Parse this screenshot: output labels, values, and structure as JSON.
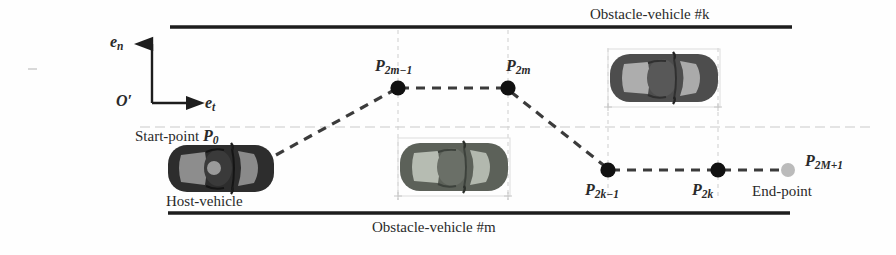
{
  "figure": {
    "type": "diagram",
    "title_top": "Obstacle-vehicle #k",
    "title_bottom": "Obstacle-vehicle #m"
  },
  "axes": {
    "origin_label": "O′",
    "normal_axis": "e",
    "normal_axis_sub": "n",
    "tangent_axis": "e",
    "tangent_axis_sub": "t",
    "origin_x": 152,
    "origin_y": 103,
    "vertical_tip_y": 41,
    "horizontal_tip_x": 206
  },
  "road": {
    "top_line_y": 27,
    "top_line_x1": 170,
    "top_line_x2": 792,
    "bottom_line_y": 213,
    "bottom_line_x1": 168,
    "bottom_line_x2": 790,
    "lane_dash_y": 127,
    "lane_dash_x1": 140,
    "lane_dash_x2": 870,
    "line_color": "#1a1a1a"
  },
  "labels": {
    "start_point": "Start-point",
    "start_point_node": "P",
    "start_point_node_sub": "0",
    "host_vehicle": "Host-vehicle",
    "end_point": "End-point",
    "end_point_node": "P",
    "end_point_node_sub": "2M+1",
    "node_p2m_minus_1": "P",
    "node_p2m_minus_1_sub": "2m−1",
    "node_p2m": "P",
    "node_p2m_sub": "2m",
    "node_p2k_minus_1": "P",
    "node_p2k_minus_1_sub": "2k−1",
    "node_p2k": "P",
    "node_p2k_sub": "2k"
  },
  "waypoints": [
    {
      "name": "P0",
      "x": 272,
      "y": 157,
      "kind": "start",
      "rendered_dot": false
    },
    {
      "name": "P2m-1",
      "x": 398,
      "y": 88,
      "kind": "node",
      "rendered_dot": true
    },
    {
      "name": "P2m",
      "x": 508,
      "y": 88,
      "kind": "node",
      "rendered_dot": true
    },
    {
      "name": "P2k-1",
      "x": 608,
      "y": 170,
      "kind": "node",
      "rendered_dot": true
    },
    {
      "name": "P2k",
      "x": 718,
      "y": 170,
      "kind": "node",
      "rendered_dot": true
    },
    {
      "name": "P2M+1",
      "x": 788,
      "y": 170,
      "kind": "end",
      "rendered_dot": true
    }
  ],
  "path_style": {
    "stroke": "#3b3b3b",
    "dash": "9 7",
    "width": 3.2,
    "node_fill": "#111111",
    "node_radius": 7.5,
    "end_node_fill": "#b9b9b9",
    "end_node_radius": 7
  },
  "vehicles": [
    {
      "id": "host-vehicle",
      "x": 168,
      "y": 145,
      "w": 106,
      "h": 48,
      "body": "#2e2e2e",
      "glass": "#8e8e8e",
      "bbox": false
    },
    {
      "id": "obstacle-vehicle-m",
      "x": 398,
      "y": 141,
      "w": 112,
      "h": 52,
      "body": "#5a6058",
      "glass": "#b4bab0",
      "bbox": true
    },
    {
      "id": "obstacle-vehicle-k",
      "x": 608,
      "y": 52,
      "w": 112,
      "h": 52,
      "body": "#4b4b4b",
      "glass": "#acacac",
      "bbox": true
    }
  ],
  "guides": {
    "color": "#cfcfcf",
    "dash": "4 4",
    "vertical_x": [
      398,
      508,
      608,
      718
    ],
    "vertical_top": 30,
    "vertical_bottom": 200
  },
  "colors": {
    "background": "#ffffff",
    "ink": "#1d1d1d",
    "text": "#2a2a2a",
    "guide": "#cfcfcf",
    "path": "#3b3b3b"
  }
}
